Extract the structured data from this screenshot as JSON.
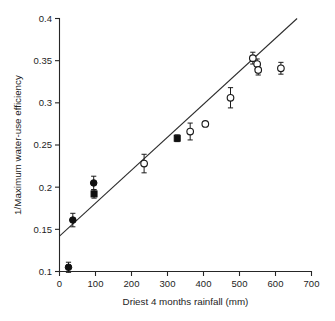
{
  "chart_data": {
    "type": "scatter",
    "title": "",
    "xlabel": "Driest 4 months rainfall (mm)",
    "ylabel": "1/Maximum water-use efficiency",
    "xlim": [
      0,
      700
    ],
    "ylim": [
      0.1,
      0.4
    ],
    "xticks": [
      0,
      100,
      200,
      300,
      400,
      500,
      600,
      700
    ],
    "yticks": [
      0.1,
      0.15,
      0.2,
      0.25,
      0.3,
      0.35,
      0.4
    ],
    "xtick_labels": [
      "0",
      "100",
      "200",
      "300",
      "400",
      "500",
      "600",
      "700"
    ],
    "ytick_labels": [
      "0.1",
      "0.15",
      "0.2",
      "0.25",
      "0.3",
      "0.35",
      "0.4"
    ],
    "grid": false,
    "legend": "none",
    "spines": [
      "left",
      "bottom"
    ],
    "series": [
      {
        "name": "filled",
        "marker": "filled-circle",
        "color": "#101010",
        "points": [
          {
            "x": 25,
            "y": 0.105,
            "yerr": 0.006,
            "marker": "filled-circle"
          },
          {
            "x": 37,
            "y": 0.161,
            "yerr": 0.008,
            "marker": "filled-circle"
          },
          {
            "x": 95,
            "y": 0.205,
            "yerr": 0.008,
            "marker": "filled-circle"
          },
          {
            "x": 96,
            "y": 0.192,
            "yerr": 0.005,
            "marker": "filled-square"
          },
          {
            "x": 327,
            "y": 0.258,
            "yerr": 0.004,
            "marker": "filled-square"
          }
        ]
      },
      {
        "name": "open",
        "marker": "open-circle",
        "color": "#ffffff",
        "points": [
          {
            "x": 235,
            "y": 0.228,
            "yerr": 0.011,
            "marker": "open-circle"
          },
          {
            "x": 363,
            "y": 0.266,
            "yerr": 0.01,
            "marker": "open-circle"
          },
          {
            "x": 405,
            "y": 0.275,
            "yerr": 0.0,
            "marker": "open-circle"
          },
          {
            "x": 475,
            "y": 0.306,
            "yerr": 0.012,
            "marker": "open-circle"
          },
          {
            "x": 537,
            "y": 0.353,
            "yerr": 0.007,
            "marker": "open-circle"
          },
          {
            "x": 549,
            "y": 0.346,
            "yerr": 0.006,
            "marker": "open-circle"
          },
          {
            "x": 552,
            "y": 0.339,
            "yerr": 0.006,
            "marker": "open-circle"
          },
          {
            "x": 615,
            "y": 0.341,
            "yerr": 0.007,
            "marker": "open-circle"
          }
        ]
      }
    ],
    "fit_line": {
      "x_start": 0,
      "y_start": 0.142,
      "x_end": 660,
      "y_end": 0.4,
      "color": "#2b2b2b"
    }
  }
}
